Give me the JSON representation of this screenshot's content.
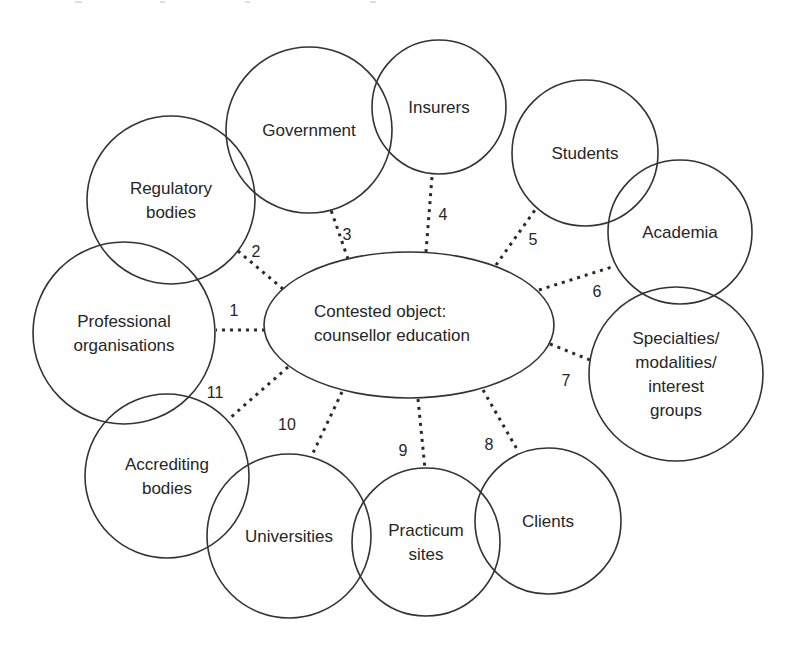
{
  "diagram": {
    "type": "activity-system network",
    "center": {
      "label_lines": [
        "Contested object:",
        "counsellor education"
      ],
      "cx": 409,
      "cy": 325,
      "rx": 145,
      "ry": 73
    },
    "nodes": [
      {
        "id": "regulatory-bodies",
        "label_lines": [
          "Regulatory",
          "bodies"
        ],
        "cx": 171,
        "cy": 200,
        "r": 84
      },
      {
        "id": "government",
        "label_lines": [
          "Government"
        ],
        "cx": 309,
        "cy": 130,
        "r": 83
      },
      {
        "id": "insurers",
        "label_lines": [
          "Insurers"
        ],
        "cx": 439,
        "cy": 107,
        "r": 67
      },
      {
        "id": "students",
        "label_lines": [
          "Students"
        ],
        "cx": 585,
        "cy": 153,
        "r": 73
      },
      {
        "id": "academia",
        "label_lines": [
          "Academia"
        ],
        "cx": 680,
        "cy": 232,
        "r": 72
      },
      {
        "id": "specialties",
        "label_lines": [
          "Specialties/",
          "modalities/",
          "interest",
          "groups"
        ],
        "cx": 676,
        "cy": 374,
        "r": 87
      },
      {
        "id": "clients",
        "label_lines": [
          "Clients"
        ],
        "cx": 548,
        "cy": 521,
        "r": 73
      },
      {
        "id": "practicum-sites",
        "label_lines": [
          "Practicum",
          "sites"
        ],
        "cx": 426,
        "cy": 542,
        "r": 74
      },
      {
        "id": "universities",
        "label_lines": [
          "Universities"
        ],
        "cx": 289,
        "cy": 536,
        "r": 82
      },
      {
        "id": "accrediting-bodies",
        "label_lines": [
          "Accrediting",
          "bodies"
        ],
        "cx": 167,
        "cy": 476,
        "r": 82
      },
      {
        "id": "professional-organisations",
        "label_lines": [
          "Professional",
          "organisations"
        ],
        "cx": 124,
        "cy": 333,
        "r": 91
      }
    ],
    "links": [
      {
        "number": "1",
        "to": "professional-organisations",
        "x1": 265,
        "y1": 330,
        "x2": 216,
        "y2": 330,
        "lx": 234,
        "ly": 316
      },
      {
        "number": "2",
        "to": "regulatory-bodies",
        "x1": 283,
        "y1": 289,
        "x2": 238,
        "y2": 251,
        "lx": 256,
        "ly": 257
      },
      {
        "number": "3",
        "to": "government",
        "x1": 348,
        "y1": 259,
        "x2": 331,
        "y2": 210,
        "lx": 347,
        "ly": 240
      },
      {
        "number": "4",
        "to": "insurers",
        "x1": 426,
        "y1": 252,
        "x2": 432,
        "y2": 177,
        "lx": 443,
        "ly": 220
      },
      {
        "number": "5",
        "to": "students",
        "x1": 496,
        "y1": 265,
        "x2": 535,
        "y2": 210,
        "lx": 533,
        "ly": 245
      },
      {
        "number": "6",
        "to": "academia",
        "x1": 539,
        "y1": 290,
        "x2": 615,
        "y2": 266,
        "lx": 597,
        "ly": 297
      },
      {
        "number": "7",
        "to": "specialties",
        "x1": 550,
        "y1": 344,
        "x2": 590,
        "y2": 360,
        "lx": 566,
        "ly": 386
      },
      {
        "number": "8",
        "to": "clients",
        "x1": 483,
        "y1": 390,
        "x2": 518,
        "y2": 451,
        "lx": 489,
        "ly": 450
      },
      {
        "number": "9",
        "to": "practicum-sites",
        "x1": 418,
        "y1": 399,
        "x2": 425,
        "y2": 469,
        "lx": 403,
        "ly": 456
      },
      {
        "number": "10",
        "to": "universities",
        "x1": 342,
        "y1": 392,
        "x2": 312,
        "y2": 455,
        "lx": 287,
        "ly": 430
      },
      {
        "number": "11",
        "to": "accrediting-bodies",
        "x1": 288,
        "y1": 367,
        "x2": 230,
        "y2": 418,
        "lx": 215,
        "ly": 398
      }
    ]
  },
  "colors": {
    "stroke": "#333333",
    "text": "#262626",
    "background": "#ffffff"
  }
}
